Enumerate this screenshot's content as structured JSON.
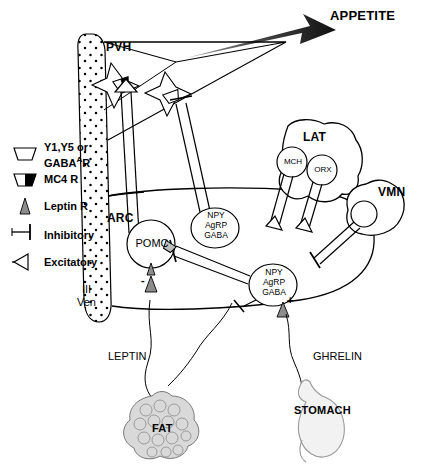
{
  "figure": {
    "type": "neuroanatomical-schematic",
    "appetite_label": "APPETITE"
  },
  "legend": {
    "items": [
      {
        "symbol": "trapezoid-open",
        "label_line1": "Y1,Y5 or",
        "label_line2_pre": "GABA",
        "label_line2_sup": "A",
        "label_line2_post": "R",
        "name": "y1-y5-gabaa-receptor"
      },
      {
        "symbol": "trapezoid-half-filled",
        "label": "MC4 R",
        "name": "mc4-receptor"
      },
      {
        "symbol": "small-triangle",
        "label": "Leptin R",
        "name": "leptin-receptor"
      },
      {
        "symbol": "t-bar",
        "label": "Inhibitory",
        "name": "inhibitory-synapse"
      },
      {
        "symbol": "open-wedge",
        "label": "Excitatory",
        "name": "excitatory-synapse"
      }
    ]
  },
  "regions": {
    "pvh": "PVH",
    "arc": "ARC",
    "lat": "LAT",
    "vmn": "VMN",
    "ventricle_line1": "III",
    "ventricle_line2": "Ven"
  },
  "neurons": {
    "pomc": "POMC",
    "npy_arc_upper": {
      "line1": "NPY",
      "line2": "AgRP",
      "line3": "GABA"
    },
    "npy_arc_lower": {
      "line1": "NPY",
      "line2": "AgRP",
      "line3": "GABA"
    },
    "mch": "MCH",
    "orx": "ORX"
  },
  "periphery": {
    "leptin": "LEPTIN",
    "fat": "FAT",
    "ghrelin": "GHRELIN",
    "stomach": "STOMACH"
  },
  "signs": {
    "pomc_leptin_sign": "-",
    "npy_leptin_sign": "+",
    "ghrelin_sign": "+"
  },
  "colors": {
    "ink": "#000000",
    "appetite_arrow": "#1a1a1a",
    "fat_fill": "#d9d9d9",
    "stomach_fill": "#f2f2f2",
    "receptor_fill": "#ffffff"
  }
}
